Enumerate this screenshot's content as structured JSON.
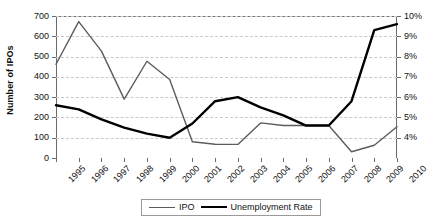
{
  "chart_data": {
    "type": "line",
    "title": "",
    "xlabel": "",
    "ylabel": "Number of IPOs",
    "ylabel_secondary": "",
    "grid": true,
    "legend_position": "bottom-center",
    "x": [
      "1995",
      "1996",
      "1997",
      "1998",
      "1999",
      "2000",
      "2001",
      "2002",
      "2003",
      "2004",
      "2005",
      "2006",
      "2007",
      "2008",
      "2009",
      "2010"
    ],
    "categories": [
      "1995",
      "1996",
      "1997",
      "1998",
      "1999",
      "2000",
      "2001",
      "2002",
      "2003",
      "2004",
      "2005",
      "2006",
      "2007",
      "2008",
      "2009",
      "2010"
    ],
    "yticks_left": [
      0,
      100,
      200,
      300,
      400,
      500,
      600,
      700
    ],
    "ylim": [
      0,
      700
    ],
    "yticks_right": [
      "4%",
      "5%",
      "6%",
      "7%",
      "8%",
      "9%",
      "10%"
    ],
    "ylim_right": [
      3.0,
      10.0
    ],
    "series": [
      {
        "name": "IPO",
        "axis": "left",
        "color": "#5c5c5c",
        "width": 1.4,
        "values": [
          462,
          672,
          527,
          290,
          477,
          387,
          80,
          68,
          67,
          173,
          160,
          160,
          160,
          31,
          63,
          154
        ]
      },
      {
        "name": "Unemployment Rate",
        "axis": "right",
        "color": "#000000",
        "width": 2.4,
        "values": [
          5.6,
          5.4,
          4.9,
          4.5,
          4.2,
          4.0,
          4.7,
          5.8,
          6.0,
          5.5,
          5.1,
          4.6,
          4.6,
          5.8,
          9.3,
          9.6
        ]
      }
    ],
    "legend": [
      "IPO",
      "Unemployment Rate"
    ]
  },
  "legend": {
    "ipo_label": "IPO",
    "unemployment_label": "Unemployment Rate"
  },
  "axes": {
    "left_title": "Number of IPOs"
  },
  "colors": {
    "ipo": "#5c5c5c",
    "unemployment": "#000000",
    "grid": "#c9c9cf",
    "axis": "#6b6b6b",
    "background": "#ffffff"
  }
}
